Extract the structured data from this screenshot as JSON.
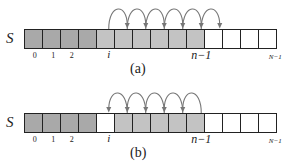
{
  "array_name": "S",
  "cell_count": 14,
  "colors": {
    "dark": "#a9a9a9",
    "light": "#c3c3c3",
    "empty": "#ffffff",
    "stroke": "#222222",
    "arc": "#777777"
  },
  "panels": [
    {
      "id": "a",
      "caption": "(a)",
      "cells": [
        "dark",
        "dark",
        "dark",
        "dark",
        "light",
        "light",
        "light",
        "light",
        "light",
        "light",
        "empty",
        "empty",
        "empty",
        "empty"
      ],
      "index_labels": [
        {
          "cell": 0,
          "text": "0"
        },
        {
          "cell": 1,
          "text": "1"
        },
        {
          "cell": 2,
          "text": "2"
        },
        {
          "cell": 4,
          "text": "i"
        },
        {
          "cell": 9,
          "text": "n−1"
        },
        {
          "cell": 13,
          "text": "N−1"
        }
      ],
      "arcs": {
        "from": [
          4,
          5,
          6,
          7,
          8,
          9
        ],
        "direction": "right"
      }
    },
    {
      "id": "b",
      "caption": "(b)",
      "cells": [
        "dark",
        "dark",
        "dark",
        "dark",
        "empty",
        "light",
        "light",
        "light",
        "light",
        "light",
        "empty",
        "empty",
        "empty",
        "empty"
      ],
      "index_labels": [
        {
          "cell": 0,
          "text": "0"
        },
        {
          "cell": 1,
          "text": "1"
        },
        {
          "cell": 2,
          "text": "2"
        },
        {
          "cell": 4,
          "text": "i"
        },
        {
          "cell": 9,
          "text": "n−1"
        },
        {
          "cell": 13,
          "text": "N−1"
        }
      ],
      "arcs": {
        "from": [
          5,
          6,
          7,
          8,
          9
        ],
        "direction": "left"
      }
    }
  ]
}
